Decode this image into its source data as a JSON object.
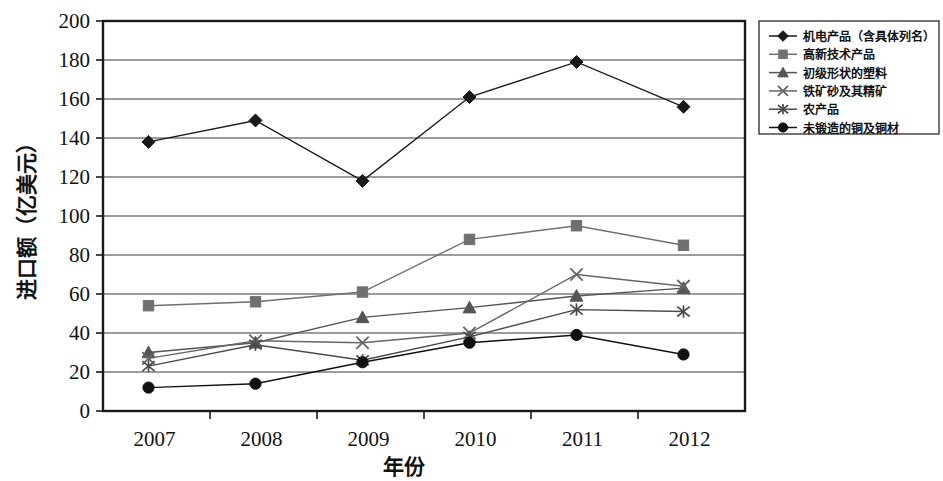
{
  "chart_data": {
    "type": "line",
    "title": "",
    "xlabel": "年份",
    "ylabel": "进口额（亿美元）",
    "categories": [
      "2007",
      "2008",
      "2009",
      "2010",
      "2011",
      "2012"
    ],
    "x": [
      2007,
      2008,
      2009,
      2010,
      2011,
      2012
    ],
    "ylim": [
      0,
      200
    ],
    "ytick_step": 20,
    "yticks": [
      "0",
      "20",
      "40",
      "60",
      "80",
      "100",
      "120",
      "140",
      "160",
      "180",
      "200"
    ],
    "grid": true,
    "legend_position": "right-top",
    "series": [
      {
        "name": "机电产品（含具体列名）",
        "marker": "diamond",
        "color": "#1a1a1a",
        "values": [
          138,
          149,
          118,
          161,
          179,
          156
        ]
      },
      {
        "name": "高新技术产品",
        "marker": "square",
        "color": "#707070",
        "values": [
          54,
          56,
          61,
          88,
          95,
          85
        ]
      },
      {
        "name": "初级形状的塑料",
        "marker": "triangle",
        "color": "#555555",
        "values": [
          30,
          35,
          48,
          53,
          59,
          63
        ]
      },
      {
        "name": "铁矿砂及其精矿",
        "marker": "x",
        "color": "#666666",
        "values": [
          27,
          36,
          35,
          40,
          70,
          64
        ]
      },
      {
        "name": "农产品",
        "marker": "star",
        "color": "#4a4a4a",
        "values": [
          23,
          34,
          26,
          38,
          52,
          51
        ]
      },
      {
        "name": "未锻造的铜及铜材",
        "marker": "circle",
        "color": "#111111",
        "values": [
          12,
          14,
          25,
          35,
          39,
          29
        ]
      }
    ]
  },
  "axis": {
    "y_title": "进口额（亿美元）",
    "x_title": "年份"
  },
  "legend": {
    "items": [
      {
        "label": "机电产品（含具体列名）",
        "marker": "diamond"
      },
      {
        "label": "高新技术产品",
        "marker": "square"
      },
      {
        "label": "初级形状的塑料",
        "marker": "triangle"
      },
      {
        "label": "铁矿砂及其精矿",
        "marker": "x"
      },
      {
        "label": "农产品",
        "marker": "star"
      },
      {
        "label": "未锻造的铜及铜材",
        "marker": "circle"
      }
    ]
  }
}
